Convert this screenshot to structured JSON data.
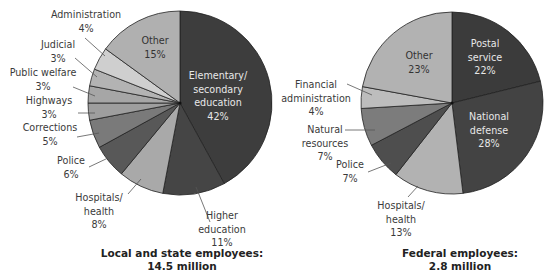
{
  "chart_data": [
    {
      "type": "pie",
      "title": "Local and state employees: 14.5 million",
      "caption_line1": "Local and state employees:",
      "caption_line2": "14.5 million",
      "center": [
        180,
        103
      ],
      "radius": 92,
      "slices": [
        {
          "label": "Elementary/ secondary education",
          "lines": [
            "Elementary/",
            "secondary",
            "education",
            "42%"
          ],
          "value": 42,
          "color": "#3d3d3d",
          "inside": true,
          "text_pos": [
            218,
            79
          ],
          "text_class": "dark"
        },
        {
          "label": "Higher education",
          "lines": [
            "Higher",
            "education",
            "11%"
          ],
          "value": 11,
          "color": "#454545",
          "inside": false,
          "text_pos": [
            222,
            219
          ],
          "leader": [
            [
              210,
              222
            ],
            [
              196,
              187
            ]
          ]
        },
        {
          "label": "Hospitals/ health",
          "lines": [
            "Hospitals/",
            "health",
            "8%"
          ],
          "value": 8,
          "color": "#a9a9a9",
          "inside": false,
          "text_pos": [
            99,
            201
          ],
          "leader": [
            [
              128,
              194
            ],
            [
              141,
              179
            ]
          ]
        },
        {
          "label": "Police",
          "lines": [
            "Police",
            "6%"
          ],
          "value": 6,
          "color": "#585858",
          "inside": false,
          "text_pos": [
            71,
            164
          ],
          "leader": [
            [
              89,
              167
            ],
            [
              108,
              158
            ]
          ]
        },
        {
          "label": "Corrections",
          "lines": [
            "Corrections",
            "5%"
          ],
          "value": 5,
          "color": "#7a7a7a",
          "inside": false,
          "text_pos": [
            50,
            131
          ],
          "leader": [
            [
              77,
              137
            ],
            [
              99,
              133
            ]
          ]
        },
        {
          "label": "Highways",
          "lines": [
            "Highways",
            "3%"
          ],
          "value": 3,
          "color": "#9e9e9e",
          "inside": false,
          "text_pos": [
            49,
            104
          ],
          "leader": [
            [
              78,
              113
            ],
            [
              95,
              113
            ]
          ]
        },
        {
          "label": "Public welfare",
          "lines": [
            "Public welfare",
            "3%"
          ],
          "value": 3,
          "color": "#a6a6a6",
          "inside": false,
          "text_pos": [
            43,
            76
          ],
          "leader": [
            [
              73,
              87
            ],
            [
              95,
              96
            ]
          ]
        },
        {
          "label": "Judicial",
          "lines": [
            "Judicial",
            "3%"
          ],
          "value": 3,
          "color": "#b3b3b3",
          "inside": false,
          "text_pos": [
            58,
            48
          ],
          "leader": [
            [
              75,
              58
            ],
            [
              97,
              77
            ]
          ]
        },
        {
          "label": "Administration",
          "lines": [
            "Administration",
            "4%"
          ],
          "value": 4,
          "color": "#cfcfcf",
          "inside": false,
          "text_pos": [
            86,
            18
          ],
          "leader": [
            [
              85,
              38
            ],
            [
              105,
              56
            ]
          ]
        },
        {
          "label": "Other",
          "lines": [
            "Other",
            "15%"
          ],
          "value": 15,
          "color": "#b0b0b0",
          "inside": true,
          "text_pos": [
            155,
            44
          ],
          "text_class": "light"
        }
      ]
    },
    {
      "type": "pie",
      "title": "Federal employees: 2.8 million",
      "caption_line1": "Federal employees:",
      "caption_line2": "2.8 million",
      "center": [
        452,
        103
      ],
      "radius": 91,
      "slices": [
        {
          "label": "Postal service",
          "lines": [
            "Postal",
            "service",
            "22%"
          ],
          "value": 22,
          "color": "#3b3b3b",
          "inside": true,
          "text_pos": [
            485,
            47
          ],
          "text_class": "dark"
        },
        {
          "label": "National defense",
          "lines": [
            "National",
            "defense",
            "28%"
          ],
          "value": 28,
          "color": "#434343",
          "inside": true,
          "text_pos": [
            489,
            120
          ],
          "text_class": "dark"
        },
        {
          "label": "Hospitals/ health",
          "lines": [
            "Hospitals/",
            "health",
            "13%"
          ],
          "value": 13,
          "color": "#b2b2b2",
          "inside": false,
          "text_pos": [
            401,
            209
          ],
          "leader": [
            [
              408,
              197
            ],
            [
              418,
              186
            ]
          ]
        },
        {
          "label": "Police",
          "lines": [
            "Police",
            "7%"
          ],
          "value": 7,
          "color": "#4e4e4e",
          "inside": false,
          "text_pos": [
            350,
            168
          ],
          "leader": [
            [
              368,
              172
            ],
            [
              391,
              163
            ]
          ]
        },
        {
          "label": "Natural resources",
          "lines": [
            "Natural",
            "resources",
            "7%"
          ],
          "value": 7,
          "color": "#7c7c7c",
          "inside": false,
          "text_pos": [
            325,
            133
          ],
          "leader": [
            [
              345,
              130
            ],
            [
              375,
              130
            ]
          ]
        },
        {
          "label": "Financial administration",
          "lines": [
            "Financial",
            "administration",
            "4%"
          ],
          "value": 4,
          "color": "#bdbdbd",
          "inside": false,
          "text_pos": [
            316,
            88
          ],
          "leader": [
            [
              347,
              84
            ],
            [
              372,
              95
            ]
          ]
        },
        {
          "label": "Other",
          "lines": [
            "Other",
            "23%"
          ],
          "value": 23,
          "color": "#b2b2b2",
          "inside": true,
          "text_pos": [
            419,
            59
          ],
          "text_class": "light"
        }
      ]
    }
  ]
}
